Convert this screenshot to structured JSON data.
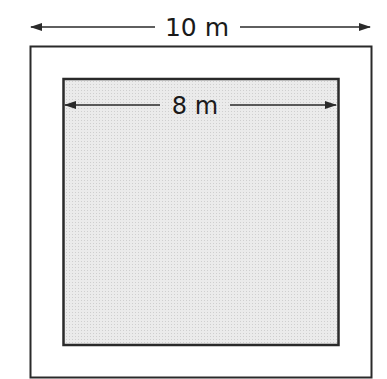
{
  "diagram": {
    "outer_square": {
      "label": "10 m",
      "fill": "#ffffff",
      "stroke": "#2a2a2a"
    },
    "inner_square": {
      "label": "8 m",
      "fill": "#e6e6e6",
      "stroke": "#2a2a2a"
    }
  }
}
